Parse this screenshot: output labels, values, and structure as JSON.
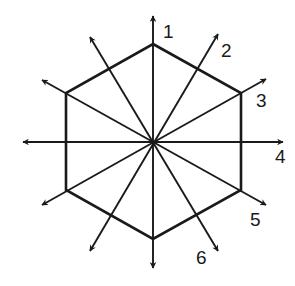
{
  "diagram": {
    "title": "",
    "shape": "regular-hexagon",
    "stroke_color": "#1a1a1a",
    "background": "#ffffff",
    "center": [
      153,
      143
    ],
    "hexagon_vertices": [
      [
        153,
        44
      ],
      [
        241,
        93
      ],
      [
        241,
        190
      ],
      [
        153,
        239
      ],
      [
        66,
        190
      ],
      [
        66,
        93
      ]
    ],
    "axes": [
      {
        "id": "1",
        "label": "1",
        "tip": [
          153,
          16
        ],
        "opposite": [
          153,
          268
        ],
        "label_pos": [
          163,
          38
        ]
      },
      {
        "id": "2",
        "label": "2",
        "tip": [
          218,
          34
        ],
        "opposite": [
          90,
          251
        ],
        "label_pos": [
          221,
          57
        ]
      },
      {
        "id": "3",
        "label": "3",
        "tip": [
          266,
          79
        ],
        "opposite": [
          42,
          205
        ],
        "label_pos": [
          256,
          107
        ]
      },
      {
        "id": "4",
        "label": "4",
        "tip": [
          283,
          142
        ],
        "opposite": [
          23,
          142
        ],
        "label_pos": [
          275,
          163
        ]
      },
      {
        "id": "5",
        "label": "5",
        "tip": [
          266,
          205
        ],
        "opposite": [
          42,
          80
        ],
        "label_pos": [
          250,
          226
        ]
      },
      {
        "id": "6",
        "label": "6",
        "tip": [
          218,
          251
        ],
        "opposite": [
          90,
          37
        ],
        "label_pos": [
          196,
          264
        ]
      }
    ],
    "labels": {
      "a1": "1",
      "a2": "2",
      "a3": "3",
      "a4": "4",
      "a5": "5",
      "a6": "6"
    }
  }
}
